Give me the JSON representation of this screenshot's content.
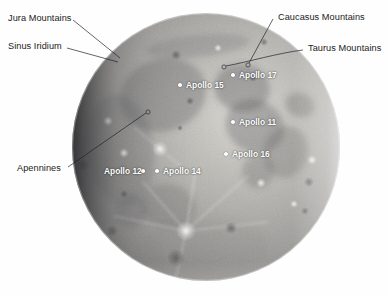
{
  "image": {
    "subject": "Moon",
    "background_color": "#ffffff",
    "width": 388,
    "height": 296
  },
  "moon": {
    "center_x": 206,
    "center_y": 147,
    "radius": 134,
    "base_color": "#8f8f8d",
    "highlight_color": "#d9d8d3",
    "shadow_color": "#4a4a4c"
  },
  "feature_annotations": [
    {
      "label": "Jura Mountains",
      "text_x": 8,
      "text_y": 14,
      "line": {
        "x1": 73,
        "y1": 20,
        "x2": 120,
        "y2": 58
      },
      "endpoint": null
    },
    {
      "label": "Sinus Iridium",
      "text_x": 8,
      "text_y": 42,
      "line": {
        "x1": 67,
        "y1": 48,
        "x2": 118,
        "y2": 62
      },
      "endpoint": null
    },
    {
      "label": "Caucasus Mountains",
      "text_x": 278,
      "text_y": 13,
      "line": {
        "x1": 273,
        "y1": 19,
        "x2": 249,
        "y2": 63
      },
      "endpoint": {
        "x": 248,
        "y": 65
      }
    },
    {
      "label": "Taurus Mountains",
      "text_x": 308,
      "text_y": 44,
      "line": {
        "x1": 303,
        "y1": 50,
        "x2": 226,
        "y2": 66
      },
      "endpoint": {
        "x": 224,
        "y": 67
      }
    },
    {
      "label": "Apennines",
      "text_x": 17,
      "text_y": 164,
      "line": {
        "x1": 68,
        "y1": 167,
        "x2": 146,
        "y2": 113
      },
      "endpoint": {
        "x": 148,
        "y": 112
      }
    }
  ],
  "landing_sites": [
    {
      "name": "Apollo 15",
      "dot_x": 180,
      "dot_y": 85,
      "label_x": 186,
      "label_y": 81,
      "label_side": "right"
    },
    {
      "name": "Apollo 17",
      "dot_x": 233,
      "dot_y": 75,
      "label_x": 239,
      "label_y": 71,
      "label_side": "right"
    },
    {
      "name": "Apollo 11",
      "dot_x": 233,
      "dot_y": 122,
      "label_x": 239,
      "label_y": 118,
      "label_side": "right"
    },
    {
      "name": "Apollo 16",
      "dot_x": 226,
      "dot_y": 154,
      "label_x": 232,
      "label_y": 150,
      "label_side": "right"
    },
    {
      "name": "Apollo 12",
      "dot_x": 143,
      "dot_y": 171,
      "label_x": 104,
      "label_y": 167,
      "label_side": "left"
    },
    {
      "name": "Apollo 14",
      "dot_x": 157,
      "dot_y": 171,
      "label_x": 163,
      "label_y": 167,
      "label_side": "right"
    }
  ],
  "mare_patches": [
    {
      "name": "mare-imbrium",
      "cx": 163,
      "cy": 95,
      "rx": 44,
      "ry": 36,
      "rot": -18,
      "opacity": 0.3
    },
    {
      "name": "mare-serenitatis",
      "cx": 242,
      "cy": 88,
      "rx": 28,
      "ry": 24,
      "rot": 10,
      "opacity": 0.34
    },
    {
      "name": "mare-tranquillitatis",
      "cx": 255,
      "cy": 126,
      "rx": 30,
      "ry": 26,
      "rot": 25,
      "opacity": 0.32
    },
    {
      "name": "mare-fecunditatis",
      "cx": 286,
      "cy": 152,
      "rx": 22,
      "ry": 26,
      "rot": 15,
      "opacity": 0.28
    },
    {
      "name": "mare-nectaris",
      "cx": 258,
      "cy": 171,
      "rx": 16,
      "ry": 17,
      "rot": 0,
      "opacity": 0.26
    },
    {
      "name": "oceanus-procellarum",
      "cx": 120,
      "cy": 150,
      "rx": 34,
      "ry": 56,
      "rot": -8,
      "opacity": 0.22
    },
    {
      "name": "mare-nubium",
      "cx": 168,
      "cy": 206,
      "rx": 28,
      "ry": 22,
      "rot": 12,
      "opacity": 0.22
    },
    {
      "name": "mare-humorum",
      "cx": 131,
      "cy": 211,
      "rx": 16,
      "ry": 17,
      "rot": 0,
      "opacity": 0.24
    },
    {
      "name": "mare-crisium",
      "cx": 300,
      "cy": 105,
      "rx": 15,
      "ry": 12,
      "rot": 20,
      "opacity": 0.3
    },
    {
      "name": "mare-frigoris",
      "cx": 198,
      "cy": 46,
      "rx": 52,
      "ry": 11,
      "rot": -6,
      "opacity": 0.22
    },
    {
      "name": "southern-highlands",
      "cx": 206,
      "cy": 248,
      "rx": 64,
      "ry": 30,
      "rot": 0,
      "opacity": 0.1
    }
  ],
  "craters": [
    {
      "name": "tycho",
      "cx": 186,
      "cy": 231,
      "r": 5.5,
      "bright": 0.55
    },
    {
      "name": "copernicus",
      "cx": 160,
      "cy": 149,
      "r": 4.4,
      "bright": 0.5
    },
    {
      "name": "kepler",
      "cx": 124,
      "cy": 153,
      "r": 3.0,
      "bright": 0.45
    },
    {
      "name": "aristarchus",
      "cx": 108,
      "cy": 121,
      "r": 3.0,
      "bright": 0.55
    },
    {
      "name": "plato",
      "cx": 176,
      "cy": 55,
      "r": 3.6,
      "bright": 0.22
    },
    {
      "name": "clavius",
      "cx": 176,
      "cy": 258,
      "r": 7.0,
      "bright": 0.26
    },
    {
      "name": "grimaldi",
      "cx": 83,
      "cy": 165,
      "r": 4.0,
      "bright": 0.18
    },
    {
      "name": "langrenus",
      "cx": 312,
      "cy": 160,
      "r": 3.4,
      "bright": 0.4
    },
    {
      "name": "petavius",
      "cx": 309,
      "cy": 182,
      "r": 3.6,
      "bright": 0.32
    },
    {
      "name": "theophilus",
      "cx": 261,
      "cy": 183,
      "r": 3.6,
      "bright": 0.38
    },
    {
      "name": "maurolycus",
      "cx": 231,
      "cy": 228,
      "r": 4.2,
      "bright": 0.28
    },
    {
      "name": "stevinus",
      "cx": 294,
      "cy": 204,
      "r": 2.6,
      "bright": 0.42
    },
    {
      "name": "gassendi",
      "cx": 124,
      "cy": 194,
      "r": 3.0,
      "bright": 0.3
    },
    {
      "name": "eratosthenes",
      "cx": 180,
      "cy": 128,
      "r": 2.6,
      "bright": 0.3
    },
    {
      "name": "archimedes",
      "cx": 190,
      "cy": 101,
      "r": 2.8,
      "bright": 0.26
    },
    {
      "name": "posidonius",
      "cx": 253,
      "cy": 78,
      "r": 2.8,
      "bright": 0.3
    },
    {
      "name": "aristoteles",
      "cx": 218,
      "cy": 48,
      "r": 3.0,
      "bright": 0.34
    },
    {
      "name": "endymion",
      "cx": 264,
      "cy": 42,
      "r": 2.8,
      "bright": 0.26
    },
    {
      "name": "furnerius",
      "cx": 305,
      "cy": 211,
      "r": 2.8,
      "bright": 0.3
    },
    {
      "name": "schickard",
      "cx": 112,
      "cy": 231,
      "r": 4.4,
      "bright": 0.22
    }
  ],
  "rays": [
    {
      "name": "tycho-ray-north",
      "x1": 186,
      "y1": 231,
      "x2": 196,
      "y2": 168,
      "w": 2.0
    },
    {
      "name": "tycho-ray-northwest",
      "x1": 186,
      "y1": 231,
      "x2": 143,
      "y2": 182,
      "w": 1.6
    },
    {
      "name": "tycho-ray-northeast",
      "x1": 186,
      "y1": 231,
      "x2": 248,
      "y2": 176,
      "w": 1.6
    },
    {
      "name": "tycho-ray-east",
      "x1": 186,
      "y1": 231,
      "x2": 268,
      "y2": 222,
      "w": 1.4
    },
    {
      "name": "tycho-ray-west",
      "x1": 186,
      "y1": 231,
      "x2": 114,
      "y2": 216,
      "w": 1.4
    },
    {
      "name": "tycho-ray-south",
      "x1": 186,
      "y1": 231,
      "x2": 176,
      "y2": 278,
      "w": 1.4
    },
    {
      "name": "copernicus-ray-a",
      "x1": 160,
      "y1": 149,
      "x2": 134,
      "y2": 127,
      "w": 1.2
    },
    {
      "name": "copernicus-ray-b",
      "x1": 160,
      "y1": 149,
      "x2": 186,
      "y2": 171,
      "w": 1.2
    }
  ]
}
